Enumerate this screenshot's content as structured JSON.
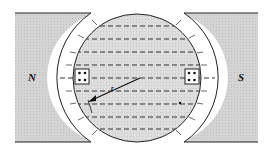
{
  "diagram": {
    "type": "electric machine cross-section",
    "labels": {
      "north_pole": "N",
      "south_pole": "S",
      "radius": "r"
    },
    "colors": {
      "pole_fill": "#cfcfcf",
      "rotor_fill": "#d9d9d9",
      "air_gap": "#ffffff",
      "stroke": "#222222",
      "flux_lines": "#333333"
    },
    "flux_line_ys": [
      26,
      39,
      52,
      65,
      78,
      91,
      104,
      117,
      129
    ],
    "slots": [
      {
        "side": "left",
        "x": 75,
        "y": 70,
        "conductors": 4
      },
      {
        "side": "right",
        "x": 186,
        "y": 70,
        "conductors": 4
      }
    ]
  }
}
